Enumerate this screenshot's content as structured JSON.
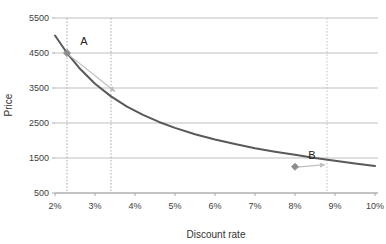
{
  "chart_data": {
    "type": "line",
    "title": "",
    "xlabel": "Discount rate",
    "ylabel": "Price",
    "xlim": [
      2,
      10
    ],
    "ylim": [
      500,
      5500
    ],
    "grid": true,
    "legend": "none",
    "x_tick_labels": [
      "2%",
      "3%",
      "4%",
      "5%",
      "6%",
      "7%",
      "8%",
      "9%",
      "10%"
    ],
    "x_tick_values": [
      2,
      3,
      4,
      5,
      6,
      7,
      8,
      9,
      10
    ],
    "y_tick_labels": [
      "5500",
      "4500",
      "3500",
      "2500",
      "1500",
      "500"
    ],
    "y_tick_values": [
      5500,
      4500,
      3500,
      2500,
      1500,
      500
    ],
    "series": [
      {
        "name": "Price curve",
        "color": "#595959",
        "x": [
          2.0,
          2.3,
          2.6,
          3.0,
          3.4,
          3.8,
          4.2,
          4.6,
          5.0,
          5.5,
          6.0,
          6.5,
          7.0,
          7.5,
          8.0,
          8.5,
          9.0,
          9.5,
          10.0
        ],
        "values": [
          5000,
          4500,
          4080,
          3620,
          3260,
          2970,
          2730,
          2530,
          2360,
          2180,
          2030,
          1900,
          1780,
          1680,
          1590,
          1500,
          1420,
          1340,
          1270
        ]
      }
    ],
    "points": [
      {
        "label": "A",
        "x": 2.3,
        "y": 4500,
        "color": "#8c8c8c"
      },
      {
        "label": "B",
        "x": 8.0,
        "y": 1250,
        "color": "#8c8c8c"
      }
    ],
    "annotations": [
      {
        "name": "arrow-from-a",
        "from_x": 2.35,
        "from_y": 4440,
        "to_x": 3.5,
        "to_y": 3400,
        "color": "#bfbfbf"
      },
      {
        "name": "arrow-from-b",
        "from_x": 8.05,
        "from_y": 1240,
        "to_x": 8.75,
        "to_y": 1310,
        "color": "#bfbfbf"
      }
    ],
    "reference_lines": [
      {
        "name": "dotted-vline-a",
        "x": 2.3,
        "style": "dotted",
        "color": "#a6a6a6"
      },
      {
        "name": "dotted-vline-mid",
        "x": 3.4,
        "style": "dotted",
        "color": "#a6a6a6"
      },
      {
        "name": "dotted-vline-b-target",
        "x": 8.8,
        "style": "dotted",
        "color": "#c0c0c0"
      }
    ],
    "colors": {
      "curve": "#595959",
      "gridline": "#bfbfbf",
      "axis": "#a6a6a6",
      "marker": "#8c8c8c",
      "arrow": "#bfbfbf",
      "text": "#333333",
      "background": "#ffffff"
    }
  }
}
